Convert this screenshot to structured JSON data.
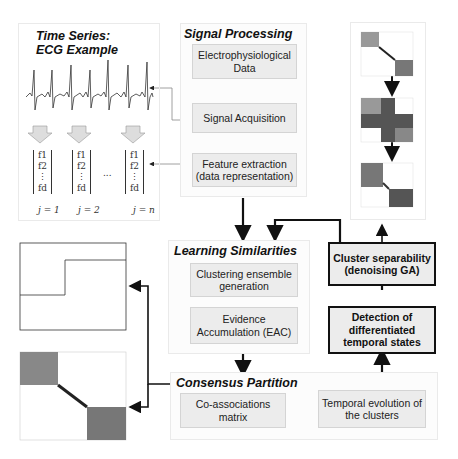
{
  "time_series_panel": {
    "title_line1": "Time Series:",
    "title_line2": "ECG Example",
    "feature_vectors": [
      {
        "f1": "f1",
        "f2": "f2",
        "fd": "fd",
        "label": "j = 1"
      },
      {
        "f1": "f1",
        "f2": "f2",
        "fd": "fd",
        "label": "j = 2"
      },
      {
        "f1": "f1",
        "f2": "f2",
        "fd": "fd",
        "label": "j = n"
      }
    ],
    "ellipsis": "..."
  },
  "signal_processing": {
    "title": "Signal Processing",
    "boxes": [
      "Electrophysiological Data",
      "Signal Acquisition",
      "Feature extraction (data representation)"
    ]
  },
  "learning_similarities": {
    "title": "Learning Similarities",
    "boxes": [
      "Clustering ensemble generation",
      "Evidence Accumulation (EAC)"
    ]
  },
  "consensus_partition": {
    "title": "Consensus Partition",
    "boxes": [
      "Co-associations matrix",
      "Temporal evolution of the clusters"
    ]
  },
  "right_boxes": {
    "cluster_separability": "Cluster separability (denoising GA)",
    "detection": "Detection of differentiated temporal states"
  },
  "colors": {
    "box_fill": "#ececec",
    "dark": "#111111",
    "matrix_gray": "#777777"
  }
}
